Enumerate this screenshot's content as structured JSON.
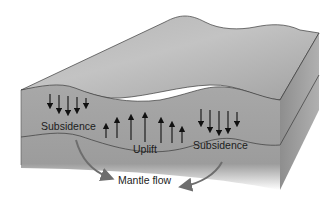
{
  "diagram": {
    "type": "block-diagram",
    "labels": {
      "subsidence_left": "Subsidence",
      "uplift": "Uplift",
      "subsidence_right": "Subsidence",
      "mantle_flow": "Mantle flow"
    },
    "arrow_groups": [
      {
        "name": "subsidence-left",
        "direction": "down",
        "count": 5
      },
      {
        "name": "uplift",
        "direction": "up",
        "count": 7
      },
      {
        "name": "subsidence-right",
        "direction": "down",
        "count": 5
      }
    ],
    "colors": {
      "top_surface": "#a9a9a9",
      "front_face": "#9e9e9e",
      "side_face": "#8f8f8f",
      "edge": "#3a3a3a",
      "arrow": "#111111",
      "flow_arrow": "#6e6e6e"
    }
  }
}
